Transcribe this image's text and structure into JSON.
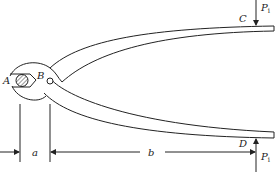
{
  "diagram": {
    "type": "mechanics-figure",
    "points": {
      "A": "A",
      "B": "B",
      "C": "C",
      "D": "D"
    },
    "forces": {
      "top": {
        "label": "P",
        "subscript": "i",
        "applied_at": "C",
        "direction": "down"
      },
      "bottom": {
        "label": "P",
        "subscript": "i",
        "applied_at": "D",
        "direction": "up"
      }
    },
    "dimensions": {
      "a": "a",
      "b": "b"
    },
    "colors": {
      "line": "#222222",
      "background": "#ffffff"
    }
  }
}
